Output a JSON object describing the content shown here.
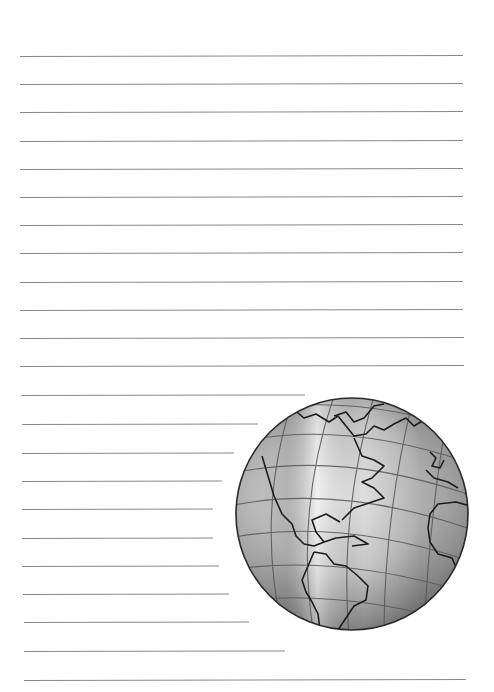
{
  "page": {
    "type": "lined-writing-paper",
    "background_color": "#ffffff",
    "line_color": "#8a8a8a",
    "line_spacing_px": 28.3,
    "lines": [
      {
        "y": 56,
        "x1": 20,
        "x2": 463
      },
      {
        "y": 84,
        "x1": 20,
        "x2": 463
      },
      {
        "y": 112,
        "x1": 20,
        "x2": 463
      },
      {
        "y": 141,
        "x1": 20,
        "x2": 463
      },
      {
        "y": 169,
        "x1": 20,
        "x2": 463
      },
      {
        "y": 197,
        "x1": 20,
        "x2": 463
      },
      {
        "y": 196,
        "x1": 20,
        "x2": 463
      },
      {
        "y": 225,
        "x1": 20,
        "x2": 463
      },
      {
        "y": 253,
        "x1": 20,
        "x2": 463
      },
      {
        "y": 282,
        "x1": 20,
        "x2": 463
      },
      {
        "y": 310,
        "x1": 20,
        "x2": 463
      },
      {
        "y": 338,
        "x1": 20,
        "x2": 464
      },
      {
        "y": 366,
        "x1": 20,
        "x2": 464
      },
      {
        "y": 395,
        "x1": 21,
        "x2": 305
      },
      {
        "y": 424,
        "x1": 22,
        "x2": 258
      },
      {
        "y": 453,
        "x1": 22,
        "x2": 234
      },
      {
        "y": 481,
        "x1": 22,
        "x2": 222
      },
      {
        "y": 509,
        "x1": 22,
        "x2": 213
      },
      {
        "y": 538,
        "x1": 22,
        "x2": 213
      },
      {
        "y": 566,
        "x1": 22,
        "x2": 219
      },
      {
        "y": 594,
        "x1": 23,
        "x2": 229
      },
      {
        "y": 622,
        "x1": 24,
        "x2": 249
      },
      {
        "y": 651,
        "x1": 24,
        "x2": 285
      },
      {
        "y": 680,
        "x1": 24,
        "x2": 466
      }
    ]
  },
  "illustration": {
    "name": "globe-illustration",
    "description": "Pencil-sketched globe showing the Americas and western Africa with latitude/longitude grid",
    "center_x": 352,
    "center_y": 514,
    "radius": 117
  }
}
